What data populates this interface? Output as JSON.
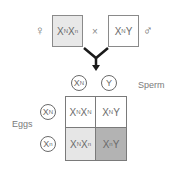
{
  "parents": {
    "female": {
      "symbol": "♀",
      "genotype": [
        [
          "X",
          "N"
        ],
        [
          "X",
          "n"
        ]
      ],
      "fill": "#e8e8e8"
    },
    "cross_symbol": "×",
    "male": {
      "symbol": "♂",
      "genotype": [
        [
          "X",
          "N"
        ],
        [
          "Y",
          ""
        ]
      ],
      "fill": "#ffffff"
    }
  },
  "gametes": {
    "sperm_label": "Sperm",
    "sperm": [
      [
        "X",
        "N"
      ],
      [
        "Y",
        ""
      ]
    ],
    "eggs_label": "Eggs",
    "eggs": [
      [
        "X",
        "N"
      ],
      [
        "X",
        "n"
      ]
    ]
  },
  "punnett": {
    "cells": [
      {
        "genotype": [
          [
            "X",
            "N"
          ],
          [
            "X",
            "N"
          ]
        ],
        "fill": "#ffffff"
      },
      {
        "genotype": [
          [
            "X",
            "N"
          ],
          [
            "Y",
            ""
          ]
        ],
        "fill": "#ffffff"
      },
      {
        "genotype": [
          [
            "X",
            "N"
          ],
          [
            "X",
            "n"
          ]
        ],
        "fill": "#e6e6e6"
      },
      {
        "genotype": [
          [
            "X",
            "n"
          ],
          [
            "Y",
            ""
          ]
        ],
        "fill": "#b3b3b3"
      }
    ]
  }
}
